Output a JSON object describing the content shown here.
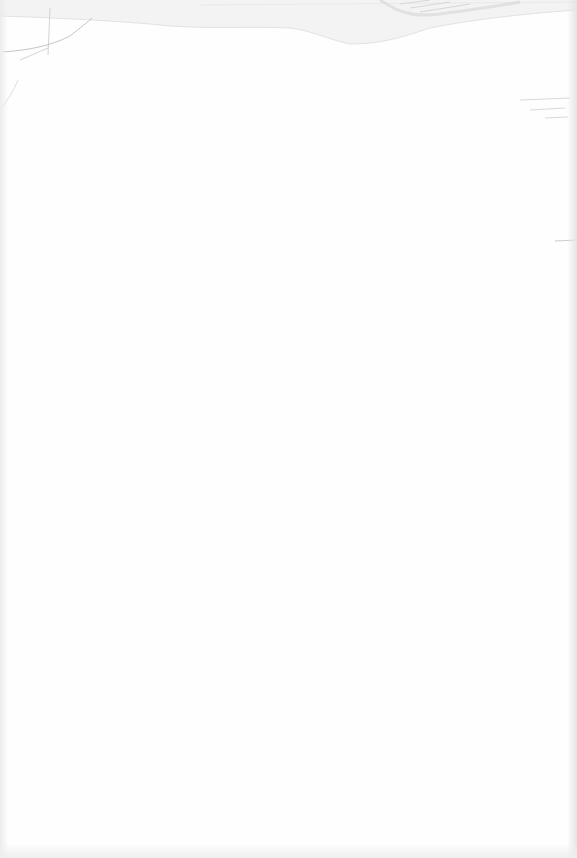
{
  "document": {
    "type": "blank-page",
    "text": "",
    "colors": {
      "paper": "#fefefe",
      "edge_shadow": "#e4e4e4",
      "crease": "#c8c8c8",
      "smudge": "#d6d6d6"
    }
  }
}
